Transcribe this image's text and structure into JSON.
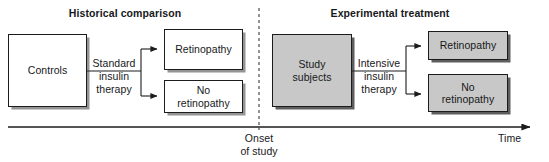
{
  "figure": {
    "type": "flow-diagram",
    "background_color": "#ffffff",
    "shaded_fill": "#c8c8c8",
    "line_color": "#1b1c1e"
  },
  "headings": {
    "left": "Historical comparison",
    "right": "Experimental treatment"
  },
  "left_group": {
    "source_box": "Controls",
    "edge_label_line1": "Standard",
    "edge_label_line2": "insulin",
    "edge_label_line3": "therapy",
    "outcome_top": "Retinopathy",
    "outcome_bottom_line1": "No",
    "outcome_bottom_line2": "retinopathy"
  },
  "right_group": {
    "source_box_line1": "Study",
    "source_box_line2": "subjects",
    "edge_label_line1": "Intensive",
    "edge_label_line2": "insulin",
    "edge_label_line3": "therapy",
    "outcome_top": "Retinopathy",
    "outcome_bottom_line1": "No",
    "outcome_bottom_line2": "retinopathy"
  },
  "axis": {
    "divider_label_line1": "Onset",
    "divider_label_line2": "of study",
    "time_label": "Time"
  }
}
